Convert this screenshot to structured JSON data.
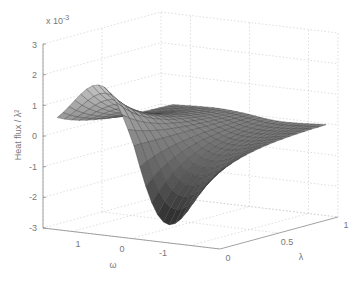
{
  "chart_data": {
    "type": "surface3d",
    "title": "",
    "xlabel": "ω",
    "ylabel": "λ",
    "zlabel": "Heat flux / λ²",
    "z_exponent_label": "x 10",
    "z_exponent_power": "-3",
    "x_ticks": [
      "1",
      "0",
      "-1"
    ],
    "x_range": [
      1.5,
      -1.5
    ],
    "y_ticks": [
      "0",
      "0.5",
      "1"
    ],
    "y_range": [
      0,
      1
    ],
    "z_ticks": [
      "3",
      "2",
      "1",
      "0",
      "-1",
      "-2",
      "-3"
    ],
    "z_range": [
      -3,
      3
    ],
    "z_scale": 0.001,
    "grid": true,
    "colormap": "gray",
    "features": {
      "peak": {
        "omega": 0.6,
        "lambda": 0.05,
        "value": 2.2
      },
      "trough": {
        "omega": -0.6,
        "lambda": 0.05,
        "value": -2.9
      },
      "asymptote_at_lambda_1": 0.0
    }
  }
}
